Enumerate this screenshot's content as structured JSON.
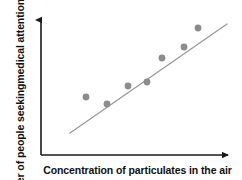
{
  "chart_data": {
    "type": "scatter",
    "title": "",
    "subtitle": "",
    "xlabel": "Concentration of particulates in the air",
    "ylabel": "Number of people seeking medical attention for asthma",
    "ylabel_lines": [
      "Number of people seeking",
      "medical attention for asthma"
    ],
    "xlabel_ticks": [],
    "ylabel_ticks": [],
    "grid": false,
    "legend": false,
    "legend_position": "none",
    "xlim": [
      0,
      100
    ],
    "ylim": [
      0,
      100
    ],
    "axes_style": "arrow-tipped L-shaped axes, no tick marks, no numeric scale",
    "point_color": "#8c8c8c",
    "point_radius_px": 3.4,
    "trendline_color": "#9a9a9a",
    "trendline_width_px": 1.3,
    "axis_color": "#1a1a1a",
    "background_color": "#ffffff",
    "relationship": "positive linear correlation",
    "points": [
      {
        "label": "p1",
        "x": 22.0,
        "y": 30.0,
        "px": 86,
        "py": 97
      },
      {
        "label": "p2",
        "x": 34.0,
        "y": 24.0,
        "px": 107,
        "py": 104
      },
      {
        "label": "p3",
        "x": 46.0,
        "y": 38.0,
        "px": 128,
        "py": 86
      },
      {
        "label": "p4",
        "x": 57.0,
        "y": 42.0,
        "px": 147,
        "py": 82
      },
      {
        "label": "p5",
        "x": 66.0,
        "y": 59.0,
        "px": 162,
        "py": 58
      },
      {
        "label": "p6",
        "x": 79.0,
        "y": 67.0,
        "px": 184,
        "py": 47
      },
      {
        "label": "p7",
        "x": 87.0,
        "y": 80.0,
        "px": 198,
        "py": 28
      }
    ],
    "trendline": {
      "x_start": 12.0,
      "y_start": 16.0,
      "x_end": 100.0,
      "y_end": 86.0,
      "px_start": 70,
      "py_start": 133,
      "px_end": 227,
      "py_end": 24
    },
    "axis_geometry": {
      "y_axis_x_px": 41,
      "y_axis_top_px": 14,
      "x_axis_y_px": 155,
      "x_axis_right_px": 234
    }
  }
}
